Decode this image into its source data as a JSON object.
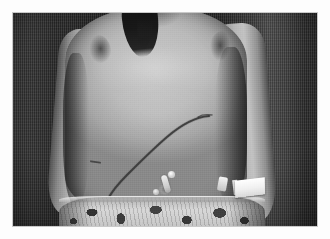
{
  "image": {
    "type": "clinical-photograph",
    "color_mode": "grayscale",
    "orientation": "landscape",
    "frame": {
      "border_color": "#ffffff",
      "border_width_px": 13
    },
    "caption": ""
  },
  "scene": {
    "subject": "child torso, anterior view, shirtless",
    "framing": "chest to hips, head cropped above frame",
    "background": {
      "name": "dark textured wall",
      "description": "dark vertically-striated backdrop with a lighter vertical band at the right",
      "color_dark": "#1e1e1e",
      "color_light": "#4c4c4c"
    }
  },
  "features": {
    "scar": {
      "label": "curved subcostal surgical scar",
      "location": "left upper quadrant sweeping down toward left hip",
      "color": "#2b2723"
    },
    "stoma": {
      "label": "small tube at umbilicus",
      "color": "#f2efe9"
    },
    "tape": {
      "label": "white adhesive tape on right forearm",
      "color": "#ffffff"
    },
    "forearm_mark": {
      "label": "small dark mark on left forearm",
      "color": "#3b3732"
    },
    "hair": {
      "label": "dark hair falling over left shoulder",
      "color": "#14110f"
    },
    "shorts": {
      "label": "patterned shorts",
      "base_color": "#e4e0d9",
      "pattern_color": "#2f2b25",
      "pattern": "dark floral / camouflage shapes on light ground"
    },
    "skin": {
      "label": "skin",
      "highlight": "#d0ccc6",
      "midtone": "#b8b3ac",
      "shadow": "#857f78"
    }
  }
}
